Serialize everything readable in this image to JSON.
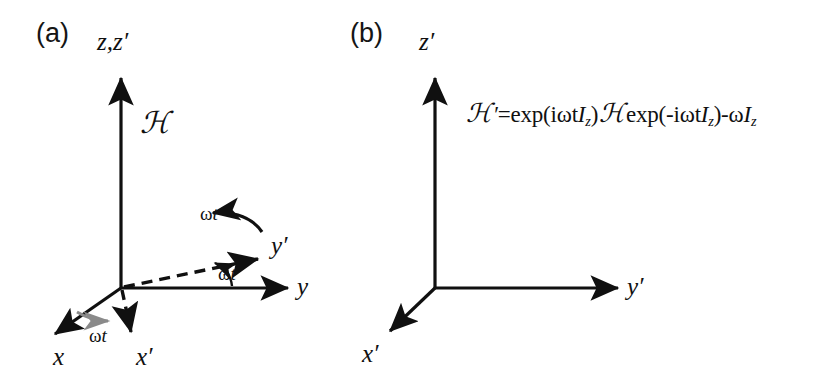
{
  "figure": {
    "background_color": "#ffffff",
    "stroke_color": "#101010",
    "accent_gray": "#8a8a8a"
  },
  "panel_a": {
    "label": "(a)",
    "axes": [
      {
        "name": "z-zprime-axis",
        "label": "z,z′",
        "style": "solid"
      },
      {
        "name": "y-axis",
        "label": "y",
        "style": "solid"
      },
      {
        "name": "x-axis",
        "label": "x",
        "style": "solid"
      },
      {
        "name": "yprime-axis",
        "label": "y′",
        "style": "dashed"
      },
      {
        "name": "xprime-axis",
        "label": "x′",
        "style": "dashed"
      }
    ],
    "hamiltonian": "ℋ",
    "angle_rotation": {
      "omega": "ω",
      "t": "t"
    },
    "angle_yz": {
      "omega": "ω",
      "t": "t"
    },
    "angle_xz": {
      "omega": "ω",
      "t": "t"
    }
  },
  "panel_b": {
    "label": "(b)",
    "axes": [
      {
        "name": "zprime-axis",
        "label": "z′",
        "style": "solid"
      },
      {
        "name": "yprime-axis",
        "label": "y′",
        "style": "solid"
      },
      {
        "name": "xprime-axis",
        "label": "x′",
        "style": "solid"
      }
    ],
    "equation": {
      "lhs_script": "ℋ",
      "lhs_prime": "′",
      "equals": "=exp(i",
      "omega1": "ω",
      "t1": "t",
      "I1": "I",
      "sub1": "z",
      "close1": ")",
      "mid_script": "ℋ",
      "exp2": "exp(-i",
      "omega2": "ω",
      "t2": "t",
      "I2": "I",
      "sub2": "z",
      "close2": ")-",
      "omega3": "ω",
      "I3": "I",
      "sub3": "z",
      "plain_text": "ℋ′=exp(iωtIz) ℋ exp(-iωtIz)-ωIz"
    }
  }
}
